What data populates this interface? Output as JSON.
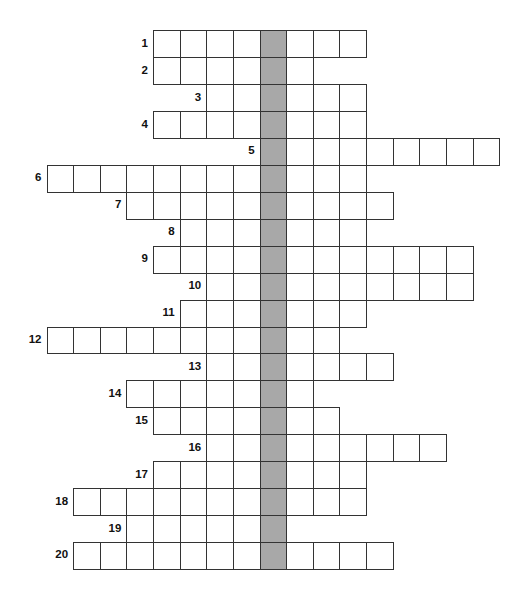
{
  "puzzle": {
    "type": "crossword-acrostic",
    "columns": 17,
    "shaded_column": 8,
    "shaded_color": "#a8a8a8",
    "rows": [
      {
        "number": "1",
        "start": 4,
        "end": 12
      },
      {
        "number": "2",
        "start": 4,
        "end": 10
      },
      {
        "number": "3",
        "start": 6,
        "end": 12
      },
      {
        "number": "4",
        "start": 4,
        "end": 12
      },
      {
        "number": "5",
        "start": 8,
        "end": 17
      },
      {
        "number": "6",
        "start": 0,
        "end": 12
      },
      {
        "number": "7",
        "start": 3,
        "end": 13
      },
      {
        "number": "8",
        "start": 5,
        "end": 12
      },
      {
        "number": "9",
        "start": 4,
        "end": 16
      },
      {
        "number": "10",
        "start": 6,
        "end": 16
      },
      {
        "number": "11",
        "start": 5,
        "end": 12
      },
      {
        "number": "12",
        "start": 0,
        "end": 11
      },
      {
        "number": "13",
        "start": 6,
        "end": 13
      },
      {
        "number": "14",
        "start": 3,
        "end": 10
      },
      {
        "number": "15",
        "start": 4,
        "end": 11
      },
      {
        "number": "16",
        "start": 6,
        "end": 15
      },
      {
        "number": "17",
        "start": 4,
        "end": 12
      },
      {
        "number": "18",
        "start": 1,
        "end": 12
      },
      {
        "number": "19",
        "start": 3,
        "end": 9
      },
      {
        "number": "20",
        "start": 1,
        "end": 13
      }
    ]
  }
}
